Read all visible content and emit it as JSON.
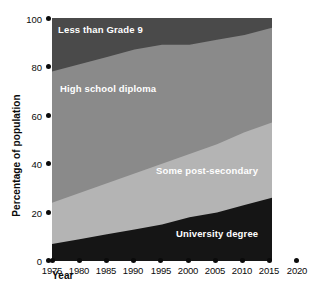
{
  "chart_data": {
    "type": "area",
    "stacked": true,
    "title": "",
    "xlabel": "Year",
    "ylabel": "Percentage of population",
    "xlim": [
      1975,
      2020
    ],
    "ylim": [
      0,
      100
    ],
    "grid": false,
    "legend_position": "inline-labels",
    "x": [
      1975,
      1980,
      1985,
      1990,
      1995,
      2000,
      2005,
      2010,
      2015
    ],
    "xtick_labels": [
      "1975",
      "1980",
      "1985",
      "1990",
      "1995",
      "2000",
      "2005",
      "2010",
      "2015",
      "2020"
    ],
    "ytick_labels": [
      "0",
      "20",
      "40",
      "60",
      "80",
      "100"
    ],
    "ytick_values": [
      0,
      20,
      40,
      60,
      80,
      100
    ],
    "series": [
      {
        "name": "University degree",
        "color": "#151515",
        "values": [
          7,
          9,
          11,
          13,
          15,
          18,
          20,
          23,
          26
        ]
      },
      {
        "name": "Some post-secondary",
        "color": "#b4b4b4",
        "values": [
          17,
          19,
          21,
          23,
          25,
          26,
          28,
          30,
          31
        ]
      },
      {
        "name": "High school diploma",
        "color": "#8a8a8a",
        "values": [
          54,
          53,
          52,
          51,
          49,
          45,
          43,
          40,
          39
        ]
      },
      {
        "name": "Less than Grade 9",
        "color": "#4a4a4a",
        "values": [
          22,
          19,
          16,
          13,
          11,
          11,
          9,
          7,
          4
        ]
      }
    ],
    "cumulative_upper_bounds": {
      "university_degree": [
        7,
        9,
        11,
        13,
        15,
        18,
        20,
        23,
        26
      ],
      "some_post_secondary": [
        24,
        28,
        32,
        36,
        40,
        44,
        48,
        53,
        57
      ],
      "high_school_diploma": [
        78,
        81,
        84,
        87,
        89,
        89,
        91,
        93,
        96
      ],
      "less_than_grade_9": [
        100,
        100,
        100,
        100,
        100,
        100,
        100,
        100,
        100
      ]
    },
    "band_labels": [
      "Less than Grade 9",
      "High school diploma",
      "Some post-secondary",
      "University degree"
    ]
  },
  "colors": {
    "background": "#ffffff",
    "axis_text": "#0b0b0b",
    "label_text": "#ffffff",
    "band_less_than_grade9": "#4a4a4a",
    "band_high_school": "#8a8a8a",
    "band_post_secondary": "#b4b4b4",
    "band_university": "#151515"
  },
  "axes": {
    "y": {
      "label": "Percentage of population",
      "ticks": [
        "100",
        "80",
        "60",
        "40",
        "20",
        "0"
      ]
    },
    "x": {
      "label": "Year",
      "ticks": [
        "1975",
        "1980",
        "1985",
        "1990",
        "1995",
        "2000",
        "2005",
        "2010",
        "2015",
        "2020"
      ]
    }
  },
  "series_labels": {
    "less_than_grade9": "Less than Grade 9",
    "high_school": "High school diploma",
    "post_secondary": "Some post-secondary",
    "university": "University degree"
  }
}
